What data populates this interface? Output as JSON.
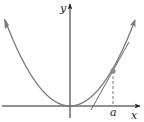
{
  "diagram": {
    "labels": {
      "y_axis": "y",
      "x_axis": "x",
      "point_x": "a"
    },
    "colors": {
      "axis": "#222222",
      "curve": "#7a7a7a",
      "tangent": "#6a6a6a",
      "point": "#8a8a8a",
      "dashed": "#777777"
    },
    "elements": [
      "x-axis with arrow",
      "y-axis with arrow",
      "parabola opening upward with vertex at origin, arrows at both ends",
      "tangent line at point (a, f(a))",
      "dashed vertical line from point to x-axis",
      "filled point at (a, f(a))"
    ]
  }
}
